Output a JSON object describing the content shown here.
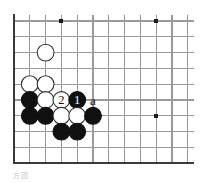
{
  "diagram": {
    "kind": "go-board-problem-diagram",
    "caption": "方図",
    "board": {
      "origin_x": 14,
      "origin_y": 21,
      "spacing": 15.8,
      "cols": 12,
      "rows": 10,
      "edges": [
        "left",
        "bottom"
      ],
      "line_color": "#9a9a9a",
      "edge_color": "#3a3a3a",
      "background": "#ffffff",
      "stone_radius": 8.4
    },
    "star_points": [
      {
        "col": 3,
        "row": 0
      },
      {
        "col": 9,
        "row": 0
      },
      {
        "col": 9,
        "row": 6
      }
    ],
    "stones": [
      {
        "col": 2,
        "row": 2,
        "color": "white",
        "label": ""
      },
      {
        "col": 1,
        "row": 4,
        "color": "white",
        "label": ""
      },
      {
        "col": 2,
        "row": 4,
        "color": "white",
        "label": ""
      },
      {
        "col": 1,
        "row": 5,
        "color": "black",
        "label": ""
      },
      {
        "col": 2,
        "row": 5,
        "color": "white",
        "label": ""
      },
      {
        "col": 3,
        "row": 5,
        "color": "white",
        "label": "2"
      },
      {
        "col": 4,
        "row": 5,
        "color": "black",
        "label": "1"
      },
      {
        "col": 1,
        "row": 6,
        "color": "black",
        "label": ""
      },
      {
        "col": 2,
        "row": 6,
        "color": "black",
        "label": ""
      },
      {
        "col": 3,
        "row": 6,
        "color": "white",
        "label": ""
      },
      {
        "col": 4,
        "row": 6,
        "color": "white",
        "label": ""
      },
      {
        "col": 5,
        "row": 6,
        "color": "black",
        "label": ""
      },
      {
        "col": 3,
        "row": 7,
        "color": "black",
        "label": ""
      },
      {
        "col": 4,
        "row": 7,
        "color": "black",
        "label": ""
      }
    ],
    "point_labels": [
      {
        "col": 5,
        "row": 5,
        "text": "a"
      }
    ],
    "colors": {
      "black_stone": "#111111",
      "white_stone": "#ffffff",
      "stone_outline": "#333333",
      "label_on_black": "#ffffff",
      "label_on_white": "#111111",
      "point_label": "#111111"
    }
  }
}
